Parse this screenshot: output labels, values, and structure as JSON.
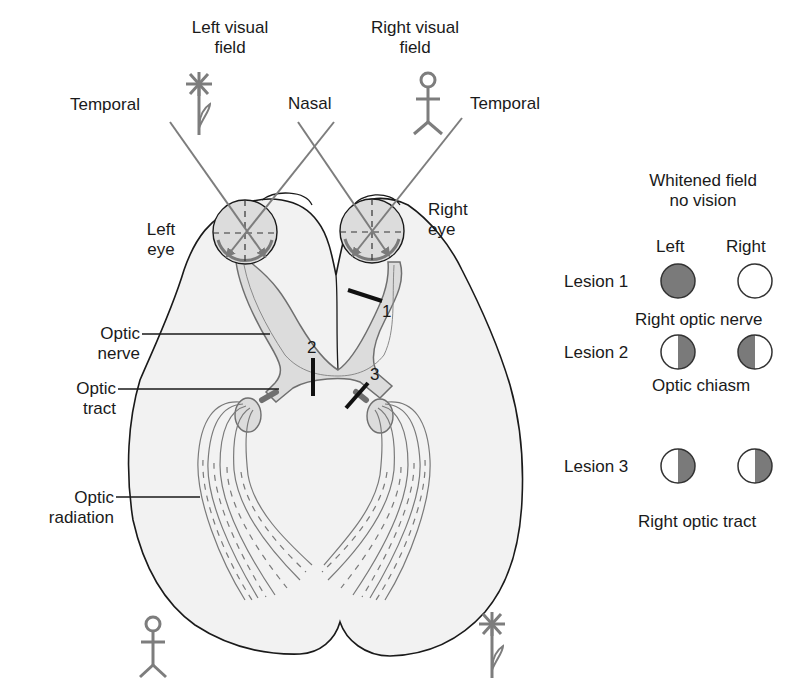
{
  "diagram": {
    "title_left_field": [
      "Left visual",
      "field"
    ],
    "title_right_field": [
      "Right visual",
      "field"
    ],
    "rays": {
      "left_temporal": "Temporal",
      "nasal": "Nasal",
      "right_temporal": "Temporal"
    },
    "eyes": {
      "left": [
        "Left",
        "eye"
      ],
      "right": [
        "Right",
        "eye"
      ]
    },
    "structures": {
      "optic_nerve": [
        "Optic",
        "nerve"
      ],
      "optic_tract": [
        "Optic",
        "tract"
      ],
      "optic_radiation": [
        "Optic",
        "radiation"
      ]
    },
    "lesion_marks": [
      "1",
      "2",
      "3"
    ],
    "icons": {
      "left_field_object": "flower-icon",
      "right_field_object": "stick-figure-icon",
      "projected_left": "stick-figure-icon",
      "projected_right": "flower-icon"
    },
    "colors": {
      "brain_fill": "#f2f2f2",
      "outline": "#1a1a1a",
      "pathway_fill": "#dcdcdc",
      "pathway_stroke": "#7a7a7a",
      "ray": "#7d7d7d",
      "lesion_bar": "#111111",
      "field_loss": "#7a7a7a"
    }
  },
  "legend": {
    "heading": [
      "Whitened field",
      "no vision"
    ],
    "col_left": "Left",
    "col_right": "Right",
    "rows": [
      {
        "label": "Lesion 1",
        "left": "full",
        "right": "none",
        "caption": "Right optic nerve"
      },
      {
        "label": "Lesion 2",
        "left": "right-half",
        "right": "left-half",
        "caption": "Optic chiasm"
      },
      {
        "label": "Lesion 3",
        "left": "right-half",
        "right": "right-half",
        "caption": "Right optic tract"
      }
    ]
  }
}
